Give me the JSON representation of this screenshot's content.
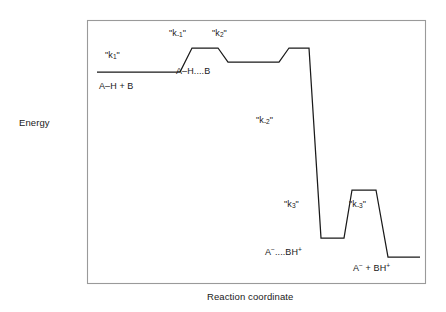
{
  "axes": {
    "y_label": "Energy",
    "x_label": "Reaction coordinate"
  },
  "rate_constants": {
    "k1": {
      "prefix": "\"k",
      "sub": "1",
      "suffix": "\""
    },
    "km1": {
      "prefix": "\"k",
      "sub": "-1",
      "suffix": "\""
    },
    "k2": {
      "prefix": "\"k",
      "sub": "2",
      "suffix": "\""
    },
    "km2": {
      "prefix": "\"k",
      "sub": "-2",
      "suffix": "\""
    },
    "k3": {
      "prefix": "\"k",
      "sub": "3",
      "suffix": "\""
    },
    "km3": {
      "prefix": "\"k",
      "sub": "-3",
      "suffix": "\""
    }
  },
  "species": {
    "reactants": {
      "main": "A–H + B",
      "sup": ""
    },
    "complex": {
      "main": "A–H....B",
      "sup": ""
    },
    "ionpair_a": "A",
    "ionpair_a_charge": "−",
    "ionpair_mid": "....BH",
    "ionpair_b_charge": "+",
    "products_a": "A",
    "products_a_charge": "−",
    "products_mid": " +  BH",
    "products_b_charge": "+"
  },
  "chart_data": {
    "type": "line",
    "title": "",
    "xlabel": "Reaction coordinate",
    "ylabel": "Energy",
    "grid": false,
    "legend": null,
    "axis_ticks": {
      "x": [],
      "y": []
    },
    "plot_frame": {
      "x": 87,
      "y": 20,
      "width": 338,
      "height": 263
    },
    "note": "Qualitative reaction-coordinate (free energy) diagram; axes are unscaled with no numeric ticks.",
    "states": [
      {
        "name": "A-H + B",
        "kind": "reactant-well",
        "energy_px": 72
      },
      {
        "name": "TS1",
        "kind": "transition-state",
        "energy_px": 48
      },
      {
        "name": "A-H....B",
        "kind": "intermediate-well",
        "energy_px": 62
      },
      {
        "name": "TS2",
        "kind": "transition-state",
        "energy_px": 48
      },
      {
        "name": "A-....BH+",
        "kind": "intermediate-well",
        "energy_px": 238
      },
      {
        "name": "TS3",
        "kind": "transition-state",
        "energy_px": 190
      },
      {
        "name": "A- + BH+",
        "kind": "product-well",
        "energy_px": 257
      }
    ],
    "path_points": [
      [
        97,
        72
      ],
      [
        180,
        72
      ],
      [
        192,
        48
      ],
      [
        218,
        48
      ],
      [
        228,
        62
      ],
      [
        279,
        62
      ],
      [
        289,
        48
      ],
      [
        309,
        48
      ],
      [
        321,
        238
      ],
      [
        344,
        238
      ],
      [
        352,
        190
      ],
      [
        376,
        190
      ],
      [
        388,
        257
      ],
      [
        420,
        257
      ]
    ]
  }
}
